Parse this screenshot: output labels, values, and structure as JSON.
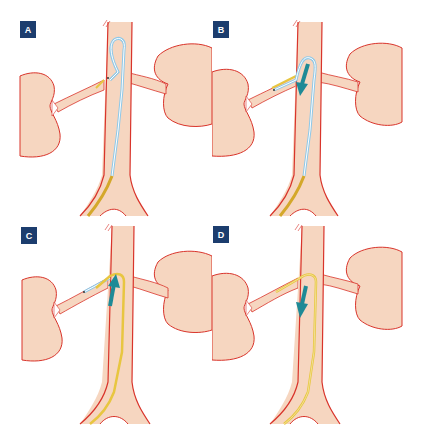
{
  "figure": {
    "colors": {
      "tissue_fill": "#f6d6c0",
      "vessel_outline": "#d9342b",
      "catheter_blue": "#8ec8e8",
      "catheter_blue_core": "#ffffff",
      "guidewire_yellow": "#e8c640",
      "sheath_gold": "#d4a82a",
      "arrow_teal": "#1e8a96",
      "label_bg": "#1c3d6e",
      "label_text": "#ffffff"
    },
    "panels": [
      {
        "id": "A",
        "label": "A",
        "step": "catheter looped in vena cava, tip engaging left renal vein",
        "arrow": "none"
      },
      {
        "id": "B",
        "label": "B",
        "step": "catheter advanced into left renal vein, withdrawn downward",
        "arrow": "down"
      },
      {
        "id": "C",
        "label": "C",
        "step": "guidewire/sheath advanced upward into renal vein",
        "arrow": "up"
      },
      {
        "id": "D",
        "label": "D",
        "step": "catheter removed, sheath withdrawn downward",
        "arrow": "down"
      }
    ]
  }
}
